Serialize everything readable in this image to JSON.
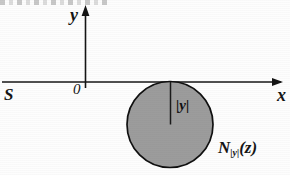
{
  "figure": {
    "title_fragment_visible": "",
    "background_color": "#fdfdfd",
    "ink_color": "#141414",
    "circle_fill_color": "#9c9c9c",
    "circle_stroke_color": "#101010"
  },
  "axes": {
    "y_axis_label": "y",
    "x_axis_label": "x",
    "origin_label": "0",
    "left_end_label": "S",
    "x_axis_y_px": 82,
    "y_axis_x_px": 85,
    "x_axis_from_px": 2,
    "x_axis_to_px": 283,
    "y_axis_from_px": 6,
    "y_axis_to_px": 88
  },
  "disk": {
    "center_x_px": 170,
    "center_y_px": 124,
    "radius_px": 43,
    "tangent_to_x_axis": true,
    "label": "N",
    "label_subscript": "|y|",
    "label_argument": "(z)",
    "radius_segment_label": "|y|"
  }
}
